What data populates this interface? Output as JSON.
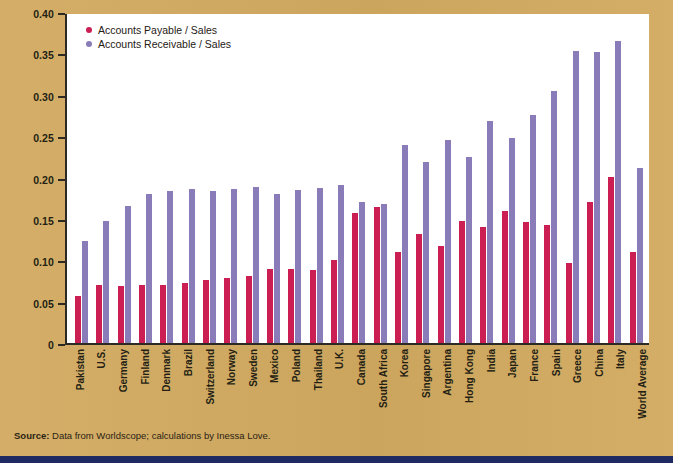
{
  "figure": {
    "background_color": "#d2aa60",
    "plot_background_color": "#ffffff",
    "bottom_rule_color": "#1f2a63"
  },
  "source_note": {
    "label": "Source:",
    "text": " Data from Worldscope; calculations by Inessa Love."
  },
  "chart_data": {
    "type": "bar",
    "title": "",
    "subtitle": "",
    "xlabel": "",
    "ylabel": "",
    "ylim": [
      0,
      0.4
    ],
    "grid": false,
    "legend_position": "top-left",
    "ytick_labels": [
      "0.40",
      "0.35",
      "0.30",
      "0.25",
      "0.20",
      "0.15",
      "0.10",
      "0.05",
      "0"
    ],
    "ytick_values": [
      0.4,
      0.35,
      0.3,
      0.25,
      0.2,
      0.15,
      0.1,
      0.05,
      0
    ],
    "categories": [
      "Pakistan",
      "U.S.",
      "Germany",
      "Finland",
      "Denmark",
      "Brazil",
      "Switzerland",
      "Norway",
      "Sweden",
      "Mexico",
      "Poland",
      "Thailand",
      "U.K.",
      "Canada",
      "South Africa",
      "Korea",
      "Singapore",
      "Argentina",
      "Hong Kong",
      "India",
      "Japan",
      "France",
      "Spain",
      "Greece",
      "China",
      "Italy",
      "World Average"
    ],
    "series": [
      {
        "name": "Accounts Payable / Sales",
        "color": "#cb1f54",
        "values": [
          0.057,
          0.07,
          0.069,
          0.07,
          0.07,
          0.072,
          0.076,
          0.079,
          0.081,
          0.09,
          0.089,
          0.088,
          0.1,
          0.157,
          0.164,
          0.11,
          0.132,
          0.117,
          0.147,
          0.14,
          0.16,
          0.146,
          0.143,
          0.097,
          0.171,
          0.201,
          0.11
        ]
      },
      {
        "name": "Accounts Receivable / Sales",
        "color": "#8a7cb8",
        "values": [
          0.123,
          0.148,
          0.165,
          0.18,
          0.184,
          0.186,
          0.184,
          0.186,
          0.189,
          0.18,
          0.185,
          0.187,
          0.191,
          0.17,
          0.168,
          0.239,
          0.219,
          0.245,
          0.225,
          0.268,
          0.248,
          0.276,
          0.305,
          0.353,
          0.352,
          0.365,
          0.211
        ]
      }
    ]
  }
}
